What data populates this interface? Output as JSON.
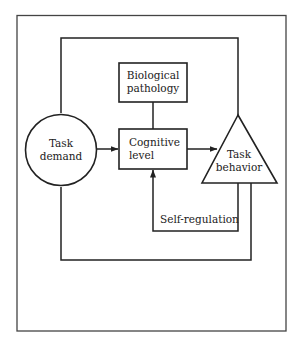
{
  "diagram": {
    "nodes": {
      "task_demand": {
        "line1": "Task",
        "line2": "demand",
        "shape": "circle"
      },
      "biological_pathology": {
        "line1": "Biological",
        "line2": "pathology",
        "shape": "rectangle"
      },
      "cognitive_level": {
        "line1": "Cognitive",
        "line2": "level",
        "shape": "rectangle"
      },
      "task_behavior": {
        "line1": "Task",
        "line2": "behavior",
        "shape": "triangle"
      }
    },
    "edges": [
      {
        "from": "Task demand",
        "to": "Cognitive level",
        "arrow": true
      },
      {
        "from": "Cognitive level",
        "to": "Task behavior",
        "arrow": true
      },
      {
        "from": "Biological pathology",
        "to": "Cognitive level",
        "arrow": false
      },
      {
        "from": "Task demand",
        "to": "Task behavior",
        "route": "top loop",
        "arrow": false
      },
      {
        "from": "Task behavior",
        "to": "Cognitive level",
        "label": "Self-regulation",
        "arrow": true
      },
      {
        "from": "Task behavior",
        "to": "Task demand",
        "route": "bottom loop",
        "arrow": false
      }
    ],
    "edge_labels": {
      "self_regulation": "Self-regulation"
    },
    "colors": {
      "stroke": "#222222",
      "background": "#ffffff",
      "frame": "#444444"
    }
  }
}
